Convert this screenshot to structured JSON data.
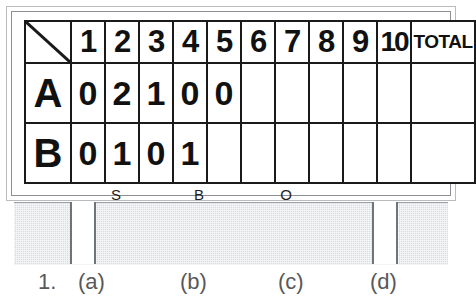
{
  "figure": {
    "type": "baseball-scoreboard-sign",
    "caption": {
      "number": "1.",
      "choice_a": "(a)",
      "choice_b": "(b)",
      "choice_c": "(c)",
      "choice_d": "(d)"
    }
  },
  "scoreboard": {
    "corner_cell": "",
    "inning_headers": [
      "1",
      "2",
      "3",
      "4",
      "5",
      "6",
      "7",
      "8",
      "9",
      "10"
    ],
    "total_header": "TOTAL",
    "rows": [
      {
        "team": "A",
        "scores": [
          "0",
          "2",
          "1",
          "0",
          "0",
          "",
          "",
          "",
          "",
          ""
        ],
        "total": ""
      },
      {
        "team": "B",
        "scores": [
          "0",
          "1",
          "0",
          "1",
          "",
          "",
          "",
          "",
          "",
          ""
        ],
        "total": ""
      }
    ],
    "count_labels": {
      "strikes": "S",
      "balls": "B",
      "outs": "O"
    }
  },
  "colors": {
    "grid_line": "#1a1a1a",
    "text": "#111111",
    "base_gray": "#d9dde1",
    "frame_gray": "#8d9195",
    "caption_gray": "#58585a",
    "board_background": "#ffffff"
  }
}
